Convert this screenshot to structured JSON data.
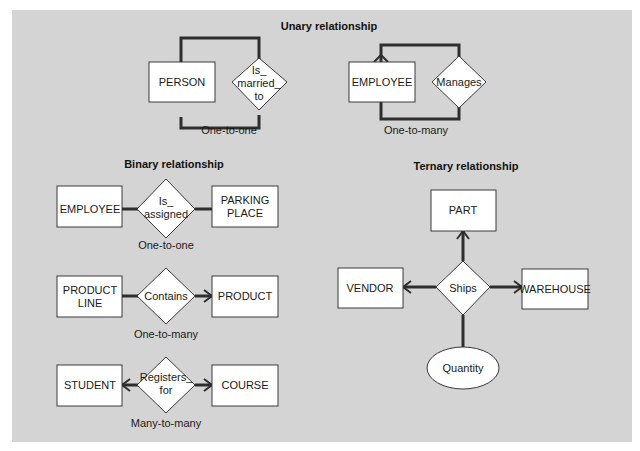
{
  "sections": {
    "unary": {
      "title": "Unary relationship",
      "person": {
        "entity": "PERSON",
        "relationship": [
          "Is_",
          "married_",
          "to"
        ],
        "cardinality": "One-to-one"
      },
      "employee": {
        "entity": "EMPLOYEE",
        "relationship": [
          "Manages"
        ],
        "cardinality": "One-to-many"
      }
    },
    "binary": {
      "title": "Binary relationship",
      "rows": [
        {
          "left": [
            "EMPLOYEE"
          ],
          "relationship": [
            "Is_",
            "assigned"
          ],
          "right": [
            "PARKING",
            "PLACE"
          ],
          "cardinality": "One-to-one"
        },
        {
          "left": [
            "PRODUCT",
            "LINE"
          ],
          "relationship": [
            "Contains"
          ],
          "right": [
            "PRODUCT"
          ],
          "cardinality": "One-to-many"
        },
        {
          "left": [
            "STUDENT"
          ],
          "relationship": [
            "Registers_",
            "for"
          ],
          "right": [
            "COURSE"
          ],
          "cardinality": "Many-to-many"
        }
      ]
    },
    "ternary": {
      "title": "Ternary relationship",
      "top": "PART",
      "left": "VENDOR",
      "right": "WAREHOUSE",
      "relationship": "Ships",
      "attribute": "Quantity"
    }
  }
}
